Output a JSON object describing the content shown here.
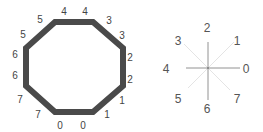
{
  "octagon": {
    "stroke_color": "#4a4a4a",
    "edge_labels": [
      {
        "text": "4",
        "x": 64,
        "y": 15
      },
      {
        "text": "4",
        "x": 85,
        "y": 15
      },
      {
        "text": "3",
        "x": 109,
        "y": 24
      },
      {
        "text": "3",
        "x": 122,
        "y": 39
      },
      {
        "text": "2",
        "x": 130,
        "y": 61
      },
      {
        "text": "2",
        "x": 130,
        "y": 83
      },
      {
        "text": "1",
        "x": 122,
        "y": 104
      },
      {
        "text": "1",
        "x": 107,
        "y": 118
      },
      {
        "text": "0",
        "x": 60,
        "y": 129
      },
      {
        "text": "0",
        "x": 83,
        "y": 129
      },
      {
        "text": "7",
        "x": 38,
        "y": 118
      },
      {
        "text": "7",
        "x": 20,
        "y": 103
      },
      {
        "text": "6",
        "x": 15,
        "y": 79
      },
      {
        "text": "6",
        "x": 15,
        "y": 58
      },
      {
        "text": "5",
        "x": 23,
        "y": 38
      },
      {
        "text": "5",
        "x": 40,
        "y": 23
      }
    ]
  },
  "star": {
    "directions": [
      {
        "text": "0",
        "x": 246,
        "y": 73
      },
      {
        "text": "1",
        "x": 237,
        "y": 45
      },
      {
        "text": "2",
        "x": 207,
        "y": 32
      },
      {
        "text": "3",
        "x": 178,
        "y": 45
      },
      {
        "text": "4",
        "x": 166,
        "y": 73
      },
      {
        "text": "5",
        "x": 178,
        "y": 103
      },
      {
        "text": "6",
        "x": 207,
        "y": 113
      },
      {
        "text": "7",
        "x": 237,
        "y": 103
      }
    ]
  }
}
